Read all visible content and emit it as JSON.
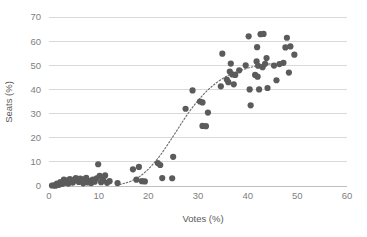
{
  "chart_data": {
    "type": "scatter",
    "title": "",
    "xlabel": "Votes (%)",
    "ylabel": "Seats (%)",
    "xlim": [
      0,
      60
    ],
    "ylim": [
      0,
      70
    ],
    "xticks": [
      0,
      10,
      20,
      30,
      40,
      50,
      60
    ],
    "yticks": [
      0,
      10,
      20,
      30,
      40,
      50,
      60,
      70
    ],
    "grid": "horizontal",
    "legend": "none",
    "marker_color": "#5b5b5b",
    "gridline_color": "#d9d9d9",
    "axis_color": "#bfbfbf",
    "tick_label_color": "#808080",
    "axis_title_color": "#595959",
    "background_color": "#ffffff",
    "series": [
      {
        "name": "Votes vs Seats",
        "marker": "circle",
        "points": [
          [
            0.6,
            0.2
          ],
          [
            1.0,
            0.3
          ],
          [
            1.3,
            0.1
          ],
          [
            1.6,
            1.0
          ],
          [
            2.0,
            0.5
          ],
          [
            2.3,
            1.6
          ],
          [
            2.7,
            0.9
          ],
          [
            3.0,
            2.6
          ],
          [
            3.2,
            1.3
          ],
          [
            3.6,
            2.2
          ],
          [
            3.9,
            1.0
          ],
          [
            4.2,
            2.9
          ],
          [
            4.5,
            2.1
          ],
          [
            4.8,
            1.4
          ],
          [
            5.1,
            2.7
          ],
          [
            5.4,
            3.3
          ],
          [
            5.7,
            2.4
          ],
          [
            6.0,
            1.7
          ],
          [
            6.3,
            3.1
          ],
          [
            6.6,
            2.3
          ],
          [
            6.9,
            1.1
          ],
          [
            7.2,
            2.9
          ],
          [
            7.5,
            3.4
          ],
          [
            7.8,
            1.5
          ],
          [
            8.1,
            2.0
          ],
          [
            8.5,
            1.2
          ],
          [
            8.8,
            2.6
          ],
          [
            9.2,
            1.8
          ],
          [
            9.6,
            3.2
          ],
          [
            9.9,
            9.0
          ],
          [
            10.2,
            4.2
          ],
          [
            10.5,
            1.6
          ],
          [
            10.9,
            2.5
          ],
          [
            11.3,
            4.4
          ],
          [
            11.7,
            1.3
          ],
          [
            12.2,
            2.0
          ],
          [
            13.8,
            1.2
          ],
          [
            16.9,
            6.9
          ],
          [
            17.6,
            2.6
          ],
          [
            18.1,
            7.9
          ],
          [
            18.7,
            2.0
          ],
          [
            19.3,
            1.9
          ],
          [
            21.9,
            9.5
          ],
          [
            22.4,
            8.7
          ],
          [
            22.8,
            3.3
          ],
          [
            24.8,
            3.2
          ],
          [
            25.0,
            12.1
          ],
          [
            27.5,
            32.0
          ],
          [
            28.9,
            39.6
          ],
          [
            30.4,
            35.0
          ],
          [
            30.9,
            34.6
          ],
          [
            30.9,
            24.9
          ],
          [
            31.6,
            24.8
          ],
          [
            32.0,
            30.4
          ],
          [
            34.6,
            41.3
          ],
          [
            34.9,
            54.8
          ],
          [
            35.8,
            44.1
          ],
          [
            36.1,
            43.0
          ],
          [
            36.4,
            47.4
          ],
          [
            36.6,
            50.7
          ],
          [
            36.9,
            46.2
          ],
          [
            37.2,
            42.1
          ],
          [
            37.5,
            46.0
          ],
          [
            38.3,
            47.9
          ],
          [
            39.6,
            50.0
          ],
          [
            40.2,
            62.0
          ],
          [
            40.4,
            40.0
          ],
          [
            40.6,
            33.4
          ],
          [
            41.5,
            46.0
          ],
          [
            41.8,
            51.6
          ],
          [
            41.9,
            57.5
          ],
          [
            42.0,
            45.3
          ],
          [
            42.1,
            49.8
          ],
          [
            42.3,
            40.0
          ],
          [
            42.6,
            62.9
          ],
          [
            43.0,
            49.2
          ],
          [
            43.2,
            63.0
          ],
          [
            43.5,
            50.6
          ],
          [
            43.8,
            53.0
          ],
          [
            44.0,
            40.6
          ],
          [
            45.3,
            49.9
          ],
          [
            45.8,
            43.8
          ],
          [
            46.4,
            50.5
          ],
          [
            47.2,
            51.0
          ],
          [
            47.6,
            57.4
          ],
          [
            47.9,
            61.4
          ],
          [
            48.3,
            47.0
          ],
          [
            48.6,
            57.8
          ],
          [
            49.4,
            54.4
          ]
        ]
      }
    ],
    "trendline": {
      "style": "dotted",
      "color": "#6a6a6a",
      "points": [
        [
          13.5,
          0.4
        ],
        [
          15.0,
          1.0
        ],
        [
          16.5,
          2.0
        ],
        [
          18.0,
          3.6
        ],
        [
          19.5,
          6.0
        ],
        [
          21.0,
          9.2
        ],
        [
          22.5,
          13.0
        ],
        [
          24.0,
          17.5
        ],
        [
          25.5,
          22.2
        ],
        [
          27.0,
          27.0
        ],
        [
          28.5,
          31.5
        ],
        [
          30.0,
          35.4
        ],
        [
          31.5,
          38.8
        ],
        [
          33.0,
          41.6
        ],
        [
          34.5,
          43.9
        ],
        [
          36.0,
          45.7
        ],
        [
          37.5,
          47.1
        ],
        [
          39.0,
          48.2
        ],
        [
          40.5,
          49.1
        ],
        [
          42.0,
          49.8
        ],
        [
          43.5,
          50.3
        ],
        [
          45.0,
          50.7
        ]
      ]
    }
  },
  "axes": {
    "y_title": "Seats (%)",
    "x_title": "Votes (%)",
    "x_tick_labels": [
      "0",
      "10",
      "20",
      "30",
      "40",
      "50",
      "60"
    ],
    "y_tick_labels": [
      "0",
      "10",
      "20",
      "30",
      "40",
      "50",
      "60",
      "70"
    ]
  }
}
